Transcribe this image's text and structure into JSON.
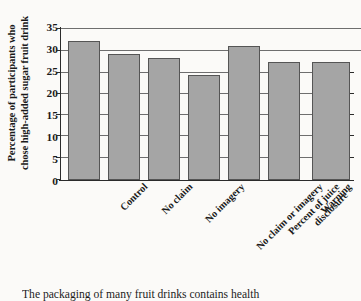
{
  "chart_data": {
    "type": "bar",
    "title": "",
    "xlabel": "",
    "ylabel": "Percentage of participants who chose high-added sugar fruit drink",
    "ylabel_lines": [
      "Percentage of participants who",
      "chose high-added sugar fruit drink"
    ],
    "categories": [
      "Control",
      "No claim",
      "No imagery",
      "No claim or imagery",
      "Percent of juice disclosure",
      "Warning",
      "Warning and teaspoons of sugar disclosure"
    ],
    "category_lines": [
      [
        "Control"
      ],
      [
        "No claim"
      ],
      [
        "No imagery"
      ],
      [
        "No claim or imagery"
      ],
      [
        "Percent of juice",
        "disclosure"
      ],
      [
        "Warning"
      ],
      [
        "Warning and teaspoons",
        "of sugar disclosure"
      ]
    ],
    "values": [
      33,
      30,
      29,
      25,
      32,
      28,
      28
    ],
    "ylim": [
      0,
      35
    ],
    "yticks": [
      0,
      5,
      10,
      15,
      20,
      25,
      30,
      35
    ],
    "ytick_labels": [
      "0",
      "5",
      "10",
      "15",
      "20",
      "25",
      "30",
      "35"
    ],
    "grid": true,
    "legend": "none",
    "bar_color": "#a5a5a5",
    "bar_border_color": "#555555",
    "axis_color": "#2b2b2b",
    "grid_color": "#6e6e6e"
  },
  "caption": {
    "text": "The packaging of many fruit drinks contains health"
  }
}
